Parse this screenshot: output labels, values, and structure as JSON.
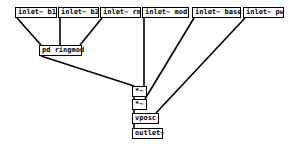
{
  "patch": {
    "objects": [
      {
        "id": "inlet-b1",
        "label": "inlet~ b1",
        "x": 15,
        "y": 7,
        "w": 42
      },
      {
        "id": "inlet-b2",
        "label": "inlet~ b2",
        "x": 58,
        "y": 7,
        "w": 41
      },
      {
        "id": "inlet-rm",
        "label": "inlet~ rm",
        "x": 100,
        "y": 7,
        "w": 41
      },
      {
        "id": "inlet-mod",
        "label": "inlet~ mod",
        "x": 142,
        "y": 7,
        "w": 47
      },
      {
        "id": "inlet-base",
        "label": "inlet~ base",
        "x": 192,
        "y": 7,
        "w": 49
      },
      {
        "id": "inlet-pw",
        "label": "inlet~ pw",
        "x": 243,
        "y": 7,
        "w": 41
      },
      {
        "id": "pd-ringmod",
        "label": "pd ringmod",
        "x": 39,
        "y": 45,
        "w": 43
      },
      {
        "id": "mul-1",
        "label": "*~",
        "x": 132,
        "y": 86,
        "w": 15
      },
      {
        "id": "mul-2",
        "label": "*~",
        "x": 132,
        "y": 99,
        "w": 15
      },
      {
        "id": "vposc",
        "label": "vposc",
        "x": 132,
        "y": 113,
        "w": 27
      },
      {
        "id": "outlet",
        "label": "outlet~",
        "x": 132,
        "y": 128,
        "w": 31
      }
    ],
    "connections": [
      {
        "from": "inlet-b1",
        "to": "pd-ringmod",
        "x1": 17,
        "y1": 18,
        "x2": 41,
        "y2": 45
      },
      {
        "from": "inlet-b2",
        "to": "pd-ringmod",
        "x1": 60,
        "y1": 18,
        "x2": 60,
        "y2": 45
      },
      {
        "from": "inlet-rm",
        "to": "pd-ringmod",
        "x1": 102,
        "y1": 18,
        "x2": 80,
        "y2": 45
      },
      {
        "from": "pd-ringmod",
        "to": "mul-1",
        "x1": 41,
        "y1": 56,
        "x2": 134,
        "y2": 86
      },
      {
        "from": "inlet-mod",
        "to": "mul-1",
        "x1": 144,
        "y1": 18,
        "x2": 144,
        "y2": 86
      },
      {
        "from": "inlet-base",
        "to": "mul-2",
        "x1": 194,
        "y1": 18,
        "x2": 145,
        "y2": 99
      },
      {
        "from": "mul-1",
        "to": "mul-2",
        "x1": 134,
        "y1": 97,
        "x2": 134,
        "y2": 99
      },
      {
        "from": "mul-2",
        "to": "vposc",
        "x1": 134,
        "y1": 110,
        "x2": 134,
        "y2": 113
      },
      {
        "from": "inlet-pw",
        "to": "vposc",
        "x1": 245,
        "y1": 18,
        "x2": 156,
        "y2": 113
      },
      {
        "from": "vposc",
        "to": "outlet",
        "x1": 134,
        "y1": 124,
        "x2": 134,
        "y2": 128
      }
    ]
  }
}
